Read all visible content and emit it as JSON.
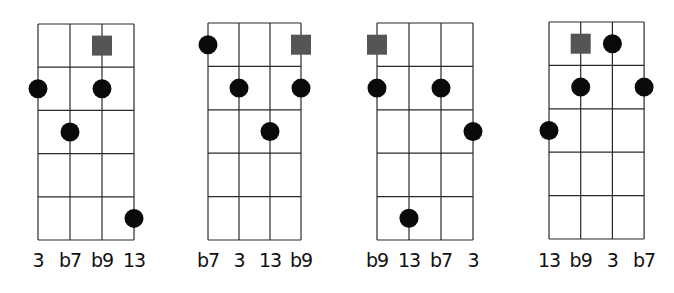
{
  "figure": {
    "colors": {
      "grid": "#2a2a2a",
      "dot": "#0a0a0a",
      "root_square": "#555555",
      "background": "#ffffff"
    },
    "legend": {
      "square": "root (not played)",
      "dot": "fretted note"
    },
    "diagrams": [
      {
        "id": "voicing-1",
        "grid": {
          "left": 38,
          "top": 24,
          "col_spacing": 32,
          "row_height": 43.2,
          "strings": 4,
          "frets": 5
        },
        "labels": [
          "3",
          "b7",
          "b9",
          "13"
        ],
        "root": {
          "string": 3,
          "fret": 1
        },
        "dots": [
          {
            "string": 1,
            "fret": 2
          },
          {
            "string": 3,
            "fret": 2
          },
          {
            "string": 2,
            "fret": 3
          },
          {
            "string": 4,
            "fret": 5
          }
        ]
      },
      {
        "id": "voicing-2",
        "grid": {
          "left": 208,
          "top": 23,
          "col_spacing": 31,
          "row_height": 43.4,
          "strings": 4,
          "frets": 5
        },
        "labels": [
          "b7",
          "3",
          "13",
          "b9"
        ],
        "root": {
          "string": 4,
          "fret": 1
        },
        "dots": [
          {
            "string": 1,
            "fret": 1
          },
          {
            "string": 2,
            "fret": 2
          },
          {
            "string": 4,
            "fret": 2
          },
          {
            "string": 3,
            "fret": 3
          }
        ]
      },
      {
        "id": "voicing-3",
        "grid": {
          "left": 377,
          "top": 23,
          "col_spacing": 32,
          "row_height": 43.4,
          "strings": 4,
          "frets": 5
        },
        "labels": [
          "b9",
          "13",
          "b7",
          "3"
        ],
        "root": {
          "string": 1,
          "fret": 1
        },
        "dots": [
          {
            "string": 1,
            "fret": 2
          },
          {
            "string": 3,
            "fret": 2
          },
          {
            "string": 4,
            "fret": 3
          },
          {
            "string": 2,
            "fret": 5
          }
        ]
      },
      {
        "id": "voicing-4",
        "grid": {
          "left": 549,
          "top": 22,
          "col_spacing": 31.7,
          "row_height": 43.4,
          "strings": 4,
          "frets": 5
        },
        "labels": [
          "13",
          "b9",
          "3",
          "b7"
        ],
        "root": {
          "string": 2,
          "fret": 1
        },
        "dots": [
          {
            "string": 3,
            "fret": 1
          },
          {
            "string": 2,
            "fret": 2
          },
          {
            "string": 4,
            "fret": 2
          },
          {
            "string": 1,
            "fret": 3
          }
        ]
      }
    ]
  }
}
